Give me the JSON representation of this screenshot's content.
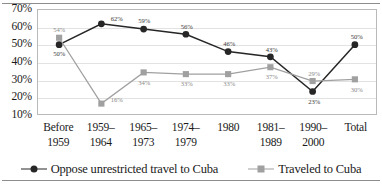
{
  "chart_data": {
    "type": "line",
    "title": "",
    "subtitle": "",
    "xlabel": "",
    "ylabel": "",
    "ylim": [
      10,
      70
    ],
    "ytick_step": 10,
    "ytick_labels": [
      "70%",
      "60%",
      "50%",
      "40%",
      "30%",
      "20%",
      "10%"
    ],
    "ytick_values": [
      70,
      60,
      50,
      40,
      30,
      20,
      10
    ],
    "grid": true,
    "grid_axis": "y",
    "legend_position": "bottom-center",
    "categories": [
      "Before 1959",
      "1959–1964",
      "1965–1973",
      "1974–1979",
      "1980",
      "1981–1989",
      "1990–2000",
      "Total"
    ],
    "category_lines": [
      [
        "Before",
        "1959"
      ],
      [
        "1959–",
        "1964"
      ],
      [
        "1965–",
        "1973"
      ],
      [
        "1974–",
        "1979"
      ],
      [
        "1980",
        ""
      ],
      [
        "1981–",
        "1989"
      ],
      [
        "1990–",
        "2000"
      ],
      [
        "Total",
        ""
      ]
    ],
    "series": [
      {
        "name": "Oppose unrestricted travel to Cuba",
        "marker": "circle",
        "color": "#262626",
        "values": [
          50,
          62,
          59,
          56,
          46,
          43,
          23,
          50
        ],
        "labels": [
          "50%",
          "62%",
          "59%",
          "56%",
          "46%",
          "43%",
          "23%",
          "50%"
        ],
        "label_positions": [
          "below",
          "right",
          "above",
          "above",
          "above",
          "above",
          "below",
          "above"
        ]
      },
      {
        "name": "Traveled to Cuba",
        "marker": "square",
        "color": "#a0a0a0",
        "values": [
          54,
          16,
          34,
          33,
          33,
          37,
          29,
          30
        ],
        "labels": [
          "54%",
          "16%",
          "34%",
          "33%",
          "33%",
          "37%",
          "29%",
          "30%"
        ],
        "label_positions": [
          "above",
          "right",
          "below",
          "below",
          "below",
          "below",
          "above",
          "below"
        ]
      }
    ]
  },
  "legend": {
    "items": [
      {
        "label": "Oppose unrestricted travel to Cuba",
        "key": "circle-marker-dark"
      },
      {
        "label": "Traveled to Cuba",
        "key": "square-marker-gray"
      }
    ]
  }
}
